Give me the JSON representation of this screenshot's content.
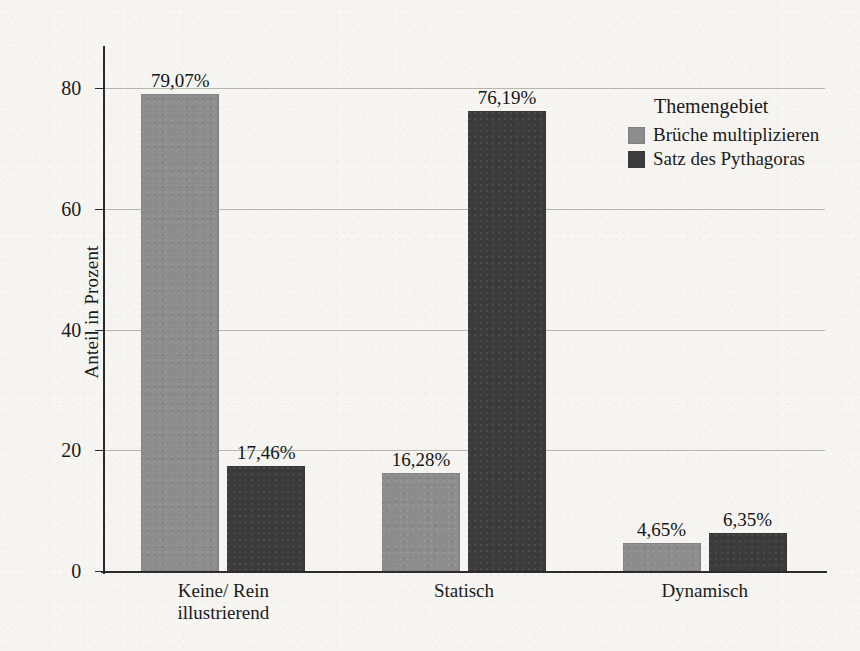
{
  "chart_data": {
    "type": "bar",
    "title": "",
    "xlabel": "",
    "ylabel": "Anteil in Prozent",
    "ylim": [
      0,
      86
    ],
    "yticks": [
      0,
      20,
      40,
      60,
      80
    ],
    "ytick_labels": [
      "0",
      "20",
      "40",
      "60",
      "80"
    ],
    "grid": true,
    "legend_position": "top-right",
    "legend_title": "Themengebiet",
    "categories": [
      "Keine/ Rein\nillustrierend",
      "Statisch",
      "Dynamisch"
    ],
    "series": [
      {
        "name": "Brüche multiplizieren",
        "color": "#8d8d8d",
        "values": [
          79.07,
          16.28,
          4.65
        ],
        "labels": [
          "79,07%",
          "16,28%",
          "4,65%"
        ]
      },
      {
        "name": "Satz des Pythagoras",
        "color": "#3c3c3c",
        "values": [
          17.46,
          76.19,
          6.35
        ],
        "labels": [
          "17,46%",
          "76,19%",
          "6,35%"
        ]
      }
    ]
  },
  "axis": {
    "y_label": "Anteil in Prozent"
  },
  "legend": {
    "title": "Themengebiet",
    "items": [
      {
        "label": "Brüche multiplizieren",
        "color": "#8d8d8d"
      },
      {
        "label": "Satz des Pythagoras",
        "color": "#3c3c3c"
      }
    ]
  },
  "ticks": {
    "y": [
      "0",
      "20",
      "40",
      "60",
      "80"
    ]
  },
  "categories": [
    {
      "line1": "Keine/ Rein",
      "line2": "illustrierend",
      "text": "Keine/ Rein\nillustrierend"
    },
    {
      "line1": "Statisch",
      "line2": "",
      "text": "Statisch"
    },
    {
      "line1": "Dynamisch",
      "line2": "",
      "text": "Dynamisch"
    }
  ],
  "bars": {
    "g0s0": "79,07%",
    "g0s1": "17,46%",
    "g1s0": "16,28%",
    "g1s1": "76,19%",
    "g2s0": "4,65%",
    "g2s1": "6,35%"
  }
}
